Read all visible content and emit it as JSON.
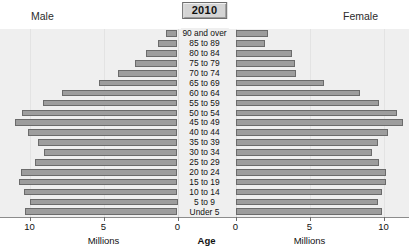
{
  "year_badge": "2010",
  "headers": {
    "male": "Male",
    "female": "Female"
  },
  "axis": {
    "left_ticks": [
      "10",
      "5",
      "0"
    ],
    "right_ticks": [
      "0",
      "5",
      "10"
    ],
    "left_unit": "Millions",
    "right_unit": "Millions",
    "center_title": "Age"
  },
  "colors": {
    "bar_fill": "#9d9d9d",
    "bar_stroke": "#6b6b6b",
    "panel_bg": "#efefef",
    "badge_bg": "#d4d4d4"
  },
  "chart_data": {
    "type": "bar",
    "title": "2010",
    "subtype": "population-pyramid",
    "xlabel": "Millions",
    "ylabel": "Age",
    "xlim": [
      0,
      11.5
    ],
    "grid": true,
    "legend": [
      "Male",
      "Female"
    ],
    "legend_position": "top-outside",
    "categories": [
      "90 and over",
      "85 to 89",
      "80 to 84",
      "75 to 79",
      "70 to 74",
      "65 to 69",
      "60 to 64",
      "55 to 59",
      "50 to 54",
      "45 to 49",
      "40 to 44",
      "35 to 39",
      "30 to 34",
      "25 to 29",
      "20 to 24",
      "15 to 19",
      "10 to 14",
      "5 to 9",
      "Under 5"
    ],
    "series": [
      {
        "name": "Male",
        "side": "left",
        "values": [
          0.8,
          1.3,
          2.1,
          2.9,
          4.0,
          5.3,
          7.8,
          9.1,
          10.5,
          11.0,
          10.1,
          9.4,
          9.0,
          9.6,
          10.6,
          10.7,
          10.4,
          10.0,
          10.3
        ]
      },
      {
        "name": "Female",
        "side": "right",
        "values": [
          2.2,
          2.0,
          3.8,
          4.0,
          4.1,
          6.0,
          8.4,
          9.7,
          10.9,
          11.3,
          10.3,
          9.6,
          9.2,
          9.7,
          10.2,
          10.2,
          9.9,
          9.6,
          9.9
        ]
      }
    ]
  }
}
